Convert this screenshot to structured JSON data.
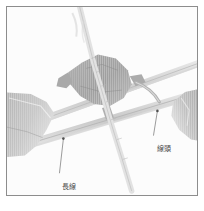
{
  "figure": {
    "kind": "annotated-micrograph",
    "frame_border_color": "#8d8d8d",
    "plate_background": "#fcfcfc",
    "leader_line_color": "#6f6f6f",
    "label_text_color": "#4a4a4a",
    "fiber_dark_color": "#9a9a9a",
    "fiber_mid_color": "#bcbcbc",
    "fiber_light_color": "#dadada",
    "thread_color": "#cfcfcf"
  },
  "annotations": [
    {
      "id": "long-thread",
      "label": "長線",
      "anchor_x": 63,
      "anchor_y": 140,
      "label_x": 55,
      "label_y": 176
    },
    {
      "id": "thread-end",
      "label": "線頭",
      "anchor_x": 158,
      "anchor_y": 112,
      "label_x": 150,
      "label_y": 138
    }
  ],
  "features": {
    "central_mass": "irregular dark fiber knot at center",
    "left_mass": "dark fiber mass at left edge",
    "right_mass": "dark fiber mass at right edge",
    "diagonal_thread_upper": "thread running lower-left to upper-right",
    "diagonal_thread_lower": "second thread running lower-left to upper-right",
    "vertical_thread": "thread descending from center toward bottom"
  }
}
